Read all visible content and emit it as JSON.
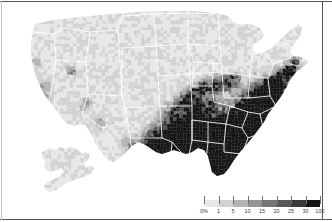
{
  "figure": {
    "projection": "albers-usa",
    "background_color": "#ffffff",
    "frame_color": "#58585a",
    "state_border_color": "#ffffff",
    "insets": [
      {
        "name": "alaska",
        "label": ""
      }
    ]
  },
  "chart_data": {
    "type": "heatmap",
    "title": "",
    "xlabel": "",
    "ylabel": "",
    "legend_position": "bottom-right",
    "grid": false,
    "unit": "%",
    "value_range": [
      0,
      100
    ],
    "legend": {
      "tick_labels": [
        "0%",
        "1",
        "5",
        "10",
        "15",
        "20",
        "25",
        "30",
        "100"
      ],
      "tick_values": [
        0,
        1,
        5,
        10,
        15,
        20,
        25,
        30,
        100
      ],
      "bin_edges": [
        0,
        1,
        5,
        10,
        15,
        20,
        25,
        30,
        100
      ],
      "bin_colors": [
        "#e8e8e8",
        "#d2d2d2",
        "#b4b4b4",
        "#949494",
        "#757575",
        "#585858",
        "#3a3a3a",
        "#141414"
      ],
      "bin_labels": [
        "0-1%",
        "1-5%",
        "5-10%",
        "10-15%",
        "15-20%",
        "20-25%",
        "25-30%",
        "30-100%"
      ]
    },
    "regional_summary": [
      {
        "region": "Deep South / Black Belt",
        "typical_value": 45,
        "bin": "30-100%"
      },
      {
        "region": "Mississippi Delta",
        "typical_value": 60,
        "bin": "30-100%"
      },
      {
        "region": "Coastal South Carolina / Georgia",
        "typical_value": 40,
        "bin": "30-100%"
      },
      {
        "region": "Eastern Virginia / Carolinas",
        "typical_value": 32,
        "bin": "30-100%"
      },
      {
        "region": "Urban Northeast corridor",
        "typical_value": 22,
        "bin": "20-25%"
      },
      {
        "region": "Great Lakes urban counties",
        "typical_value": 18,
        "bin": "15-20%"
      },
      {
        "region": "Great Plains",
        "typical_value": 1,
        "bin": "0-1%"
      },
      {
        "region": "Intermountain West",
        "typical_value": 1,
        "bin": "0-1%"
      },
      {
        "region": "Northern New England",
        "typical_value": 1,
        "bin": "0-1%"
      },
      {
        "region": "Alaska",
        "typical_value": 2,
        "bin": "1-5%"
      }
    ]
  }
}
